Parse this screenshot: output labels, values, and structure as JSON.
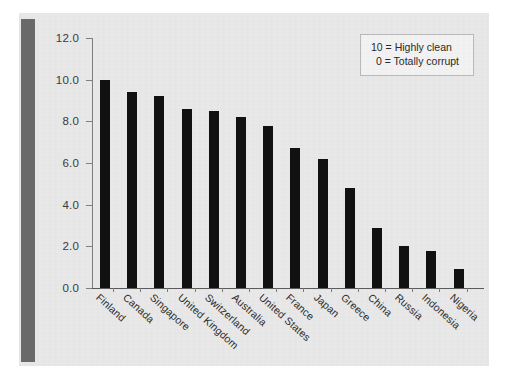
{
  "chart_data": {
    "type": "bar",
    "title": "",
    "subtitle": "",
    "xlabel": "",
    "ylabel": "",
    "ylim": [
      0.0,
      12.0
    ],
    "ytick_labels": [
      "12.0",
      "10.0",
      "8.0",
      "6.0",
      "4.0",
      "2.0",
      "0.0"
    ],
    "ytick_values": [
      12.0,
      10.0,
      8.0,
      6.0,
      4.0,
      2.0,
      0.0
    ],
    "grid": false,
    "legend_position": "top-right",
    "bar_color": "#111111",
    "categories": [
      "Finland",
      "Canada",
      "Singapore",
      "United Kingdom",
      "Switzerland",
      "Australia",
      "United States",
      "France",
      "Japan",
      "Greece",
      "China",
      "Russia",
      "Indonesia",
      "Nigeria"
    ],
    "values": [
      10.0,
      9.4,
      9.2,
      8.6,
      8.5,
      8.2,
      7.8,
      6.7,
      6.2,
      4.8,
      2.9,
      2.0,
      1.8,
      0.9
    ],
    "annotations": [
      "10 = Highly clean",
      "0 = Totally corrupt"
    ]
  },
  "legend": {
    "line1": "10 = Highly clean",
    "line2": "0 = Totally corrupt"
  },
  "colors": {
    "panel_background": "#e8e8e8",
    "spine_bar": "#6a6a6a",
    "bars": "#111111",
    "axis": "#808080",
    "legend_background": "#f2f2f2",
    "legend_border": "#b9b9b9",
    "text": "#2b2b2b"
  }
}
